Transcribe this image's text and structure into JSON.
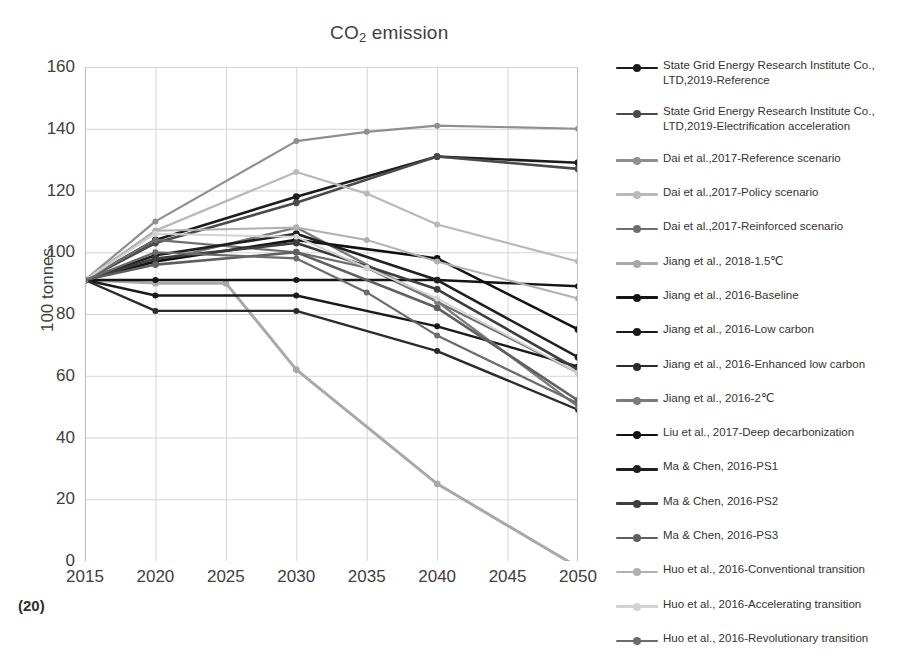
{
  "figure": {
    "caption": "(20)"
  },
  "chart_data": {
    "type": "line",
    "title_main": "CO",
    "title_sub": "2",
    "title_tail": " emission",
    "xlabel": "",
    "ylabel": "100 tonnes",
    "grid": true,
    "legend_position": "right",
    "x": [
      2015,
      2020,
      2025,
      2030,
      2035,
      2040,
      2045,
      2050
    ],
    "xticks": [
      "2015",
      "2020",
      "2025",
      "2030",
      "2035",
      "2040",
      "2045",
      "2050"
    ],
    "yticks": [
      "0",
      "20",
      "40",
      "60",
      "80",
      "100",
      "120",
      "140",
      "160"
    ],
    "xlim": [
      2015,
      2050
    ],
    "ylim": [
      0,
      160
    ],
    "series": [
      {
        "name": "State Grid Energy Research Institute Co., LTD,2019-Reference",
        "color": "#1c1c1c",
        "width": 2.6,
        "x": [
          2015,
          2020,
          2030,
          2040,
          2050
        ],
        "values": [
          91,
          104,
          118,
          131,
          129
        ]
      },
      {
        "name": "State Grid Energy Research Institute Co., LTD,2019-Electrification acceleration",
        "color": "#4a4a4a",
        "width": 2.6,
        "x": [
          2015,
          2020,
          2030,
          2040,
          2050
        ],
        "values": [
          91,
          103,
          116,
          131,
          127
        ]
      },
      {
        "name": "Dai et al.,2017-Reference scenario",
        "color": "#8f8f8f",
        "width": 2.2,
        "x": [
          2015,
          2020,
          2030,
          2035,
          2040,
          2050
        ],
        "values": [
          91,
          110,
          136,
          139,
          141,
          140
        ]
      },
      {
        "name": "Dai et al.,2017-Policy scenario",
        "color": "#b9b9b9",
        "width": 2.2,
        "x": [
          2015,
          2020,
          2030,
          2035,
          2040,
          2050
        ],
        "values": [
          91,
          107,
          126,
          119,
          109,
          97
        ]
      },
      {
        "name": "Dai et al.,2017-Reinforced scenario",
        "color": "#6e6e6e",
        "width": 2.2,
        "x": [
          2015,
          2020,
          2030,
          2035,
          2040,
          2050
        ],
        "values": [
          91,
          104,
          100,
          95,
          84,
          61
        ]
      },
      {
        "name": "Jiang et al., 2018-1.5℃",
        "color": "#a8a8a8",
        "width": 3.0,
        "x": [
          2015,
          2020,
          2025,
          2030,
          2040,
          2050
        ],
        "values": [
          91,
          90,
          90,
          62,
          25,
          -2
        ]
      },
      {
        "name": "Jiang et al., 2016-Baseline",
        "color": "#141414",
        "width": 2.4,
        "x": [
          2015,
          2020,
          2030,
          2040,
          2050
        ],
        "values": [
          91,
          91,
          91,
          91,
          89
        ]
      },
      {
        "name": "Jiang et al., 2016-Low carbon",
        "color": "#1a1a1a",
        "width": 2.4,
        "x": [
          2015,
          2020,
          2030,
          2040,
          2050
        ],
        "values": [
          91,
          86,
          86,
          76,
          63
        ]
      },
      {
        "name": "Jiang et al., 2016-Enhanced low carbon",
        "color": "#2b2b2b",
        "width": 2.4,
        "x": [
          2015,
          2020,
          2030,
          2040,
          2050
        ],
        "values": [
          91,
          81,
          81,
          68,
          49
        ]
      },
      {
        "name": "Jiang et al., 2016-2℃",
        "color": "#7b7b7b",
        "width": 2.4,
        "x": [
          2015,
          2020,
          2030,
          2040,
          2050
        ],
        "values": [
          91,
          97,
          108,
          84,
          50
        ]
      },
      {
        "name": "Liu et al., 2017-Deep decarbonization",
        "color": "#111111",
        "width": 2.6,
        "x": [
          2015,
          2020,
          2030,
          2040,
          2050
        ],
        "values": [
          91,
          97,
          104,
          98,
          75
        ]
      },
      {
        "name": "Ma & Chen, 2016-PS1",
        "color": "#1f1f1f",
        "width": 2.6,
        "x": [
          2015,
          2020,
          2030,
          2040,
          2050
        ],
        "values": [
          91,
          99,
          106,
          91,
          66
        ]
      },
      {
        "name": "Ma & Chen, 2016-PS2",
        "color": "#3d3d3d",
        "width": 2.6,
        "x": [
          2015,
          2020,
          2030,
          2040,
          2050
        ],
        "values": [
          91,
          98,
          103,
          88,
          62
        ]
      },
      {
        "name": "Ma & Chen, 2016-PS3",
        "color": "#5f5f5f",
        "width": 2.6,
        "x": [
          2015,
          2020,
          2030,
          2040,
          2050
        ],
        "values": [
          91,
          96,
          100,
          82,
          52
        ]
      },
      {
        "name": "Huo et al., 2016-Conventional transition",
        "color": "#b0b0b0",
        "width": 2.0,
        "x": [
          2015,
          2020,
          2030,
          2035,
          2040,
          2050
        ],
        "values": [
          91,
          107,
          108,
          104,
          97,
          85
        ]
      },
      {
        "name": "Huo et al., 2016-Accelerating transition",
        "color": "#d2d2d2",
        "width": 2.0,
        "x": [
          2015,
          2020,
          2030,
          2035,
          2040,
          2050
        ],
        "values": [
          91,
          106,
          105,
          95,
          85,
          61
        ]
      },
      {
        "name": "Huo et al., 2016-Revolutionary transition",
        "color": "#6b6b6b",
        "width": 2.2,
        "x": [
          2015,
          2020,
          2030,
          2035,
          2040,
          2050
        ],
        "values": [
          91,
          100,
          98,
          87,
          73,
          51
        ]
      }
    ]
  }
}
